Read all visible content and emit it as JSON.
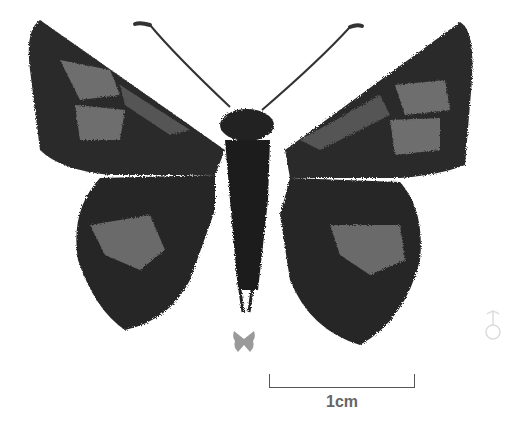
{
  "figure": {
    "scale_bar": {
      "label": "1cm"
    },
    "sex_symbol": {
      "glyph": "♂",
      "icon": "male-symbol-icon"
    },
    "view_indicator": {
      "icon": "butterfly-upperside-icon",
      "color": "#999999"
    },
    "colors": {
      "background": "#ffffff",
      "wing_dark": "#2a2a2a",
      "wing_pale": "#6e6e6e",
      "scale_bar": "#555555"
    }
  }
}
